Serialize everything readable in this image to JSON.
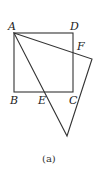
{
  "figure": {
    "caption": "(a)",
    "points": {
      "A": {
        "label": "A",
        "x": 14,
        "y": 33
      },
      "D": {
        "label": "D",
        "x": 73,
        "y": 33
      },
      "B": {
        "label": "B",
        "x": 14,
        "y": 92
      },
      "C": {
        "label": "C",
        "x": 73,
        "y": 92
      },
      "E": {
        "label": "E",
        "x": 45,
        "y": 92
      },
      "F": {
        "label": "F",
        "x": 73,
        "y": 53
      }
    },
    "shapes": {
      "square": [
        "A",
        "B",
        "C",
        "D"
      ],
      "triangle_vertices": [
        [
          14,
          33
        ],
        [
          92,
          59
        ],
        [
          67,
          136
        ]
      ]
    },
    "colors": {
      "stroke": "#333333",
      "background": "#ffffff"
    }
  }
}
